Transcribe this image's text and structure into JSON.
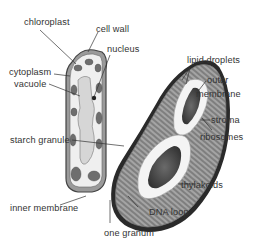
{
  "diagram": {
    "plant_cell_labels": {
      "chloroplast": "chloroplast",
      "cell_wall": "cell wall",
      "nucleus": "nucleus",
      "cytoplasm": "cytoplasm",
      "vacuole": "vacuole"
    },
    "chloroplast_labels": {
      "lipid_droplets": "lipid droplets",
      "outer_membrane_1": "outer",
      "outer_membrane_2": "membrane",
      "stroma": "stroma",
      "ribosomes": "ribosomes",
      "starch_granule": "starch granule",
      "thylakoids": "thylakoids",
      "inner_membrane": "inner membrane",
      "dna_loop": "DNA loop",
      "one_granum": "one granum"
    },
    "colors": {
      "line": "#333333",
      "outer_membrane": "#2a2a2a",
      "stroma_fill": "#8a8a8a",
      "starch": "#4a4a4a",
      "starch_halo": "#f2f2f2",
      "vacuole": "#d8d8d8",
      "cell_fill": "#eeeeee",
      "organelle": "#6a6a6a"
    }
  }
}
